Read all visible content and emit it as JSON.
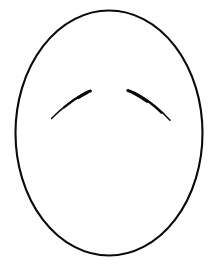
{
  "document": {
    "title": "Blank Face Template",
    "description": "Line drawing of an empty oval face outline with two curved eyebrows and no other facial features",
    "caption": "Blank face template with eyebrows",
    "width": 218,
    "height": 267
  },
  "canvas": {
    "background_color": "#ffffff",
    "stroke_color": "#000000"
  },
  "drawing": {
    "type": "line-art",
    "shapes": [
      {
        "name": "head-outline",
        "kind": "ellipse",
        "label": "Head outline",
        "cx": 109,
        "cy": 133,
        "rx": 93.5,
        "ry": 122.5,
        "stroke_color": "#0a0a0a",
        "stroke_width": 2.1,
        "fill": "none"
      },
      {
        "name": "left-eyebrow",
        "kind": "arc",
        "label": "Left eyebrow",
        "path": "M 51.5 118.5 C 60 110 73 99.5 83 94 C 86 92.4 88.4 91.4 90.3 90.8",
        "stroke_color": "#0a0a0a",
        "stroke_width_start": 1.4,
        "stroke_width_end": 3.0,
        "start_point": [
          51.5,
          118.5
        ],
        "end_point": [
          90.3,
          90.8
        ]
      },
      {
        "name": "right-eyebrow",
        "kind": "arc",
        "label": "Right eyebrow",
        "path": "M 127.8 90.3 C 130.5 91 134 92.3 138 94.5 C 149 100.5 162 111.5 170 120.2",
        "stroke_color": "#0a0a0a",
        "stroke_width_start": 3.0,
        "stroke_width_end": 1.4,
        "start_point": [
          127.8,
          90.3
        ],
        "end_point": [
          170,
          120.2
        ]
      }
    ],
    "absent_features": [
      "eyes",
      "nose",
      "mouth",
      "ears",
      "hair"
    ]
  }
}
